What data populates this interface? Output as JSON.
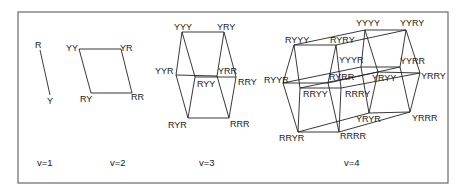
{
  "figure": {
    "frame": {
      "x": 18,
      "y": 12,
      "w": 430,
      "h": 171,
      "stroke": "#6a6a6a"
    },
    "panels": [
      {
        "id": "v1",
        "caption": "v=1",
        "caption_pos": [
          37,
          166
        ],
        "nodes": [
          {
            "label": "R",
            "x": 40,
            "y": 50,
            "lx": 35,
            "ly": 48
          },
          {
            "label": "Y",
            "x": 50,
            "y": 95,
            "lx": 47,
            "ly": 104
          }
        ],
        "edges": [
          [
            0,
            1
          ]
        ]
      },
      {
        "id": "v2",
        "caption": "v=2",
        "caption_pos": [
          110,
          166
        ],
        "nodes": [
          {
            "label": "YY",
            "x": 79,
            "y": 49,
            "lx": 66,
            "ly": 51
          },
          {
            "label": "YR",
            "x": 121,
            "y": 49,
            "lx": 120,
            "ly": 51
          },
          {
            "label": "RY",
            "x": 91,
            "y": 93,
            "lx": 80,
            "ly": 102
          },
          {
            "label": "RR",
            "x": 132,
            "y": 93,
            "lx": 131,
            "ly": 100
          }
        ],
        "edges": [
          [
            0,
            1
          ],
          [
            0,
            2
          ],
          [
            1,
            3
          ],
          [
            2,
            3
          ]
        ]
      },
      {
        "id": "v3",
        "caption": "v=3",
        "caption_pos": [
          199,
          166
        ],
        "nodes": [
          {
            "label": "YYY",
            "x": 182,
            "y": 32,
            "lx": 174,
            "ly": 30
          },
          {
            "label": "YRY",
            "x": 224,
            "y": 32,
            "lx": 217,
            "ly": 30
          },
          {
            "label": "YYR",
            "x": 176,
            "y": 75,
            "lx": 155,
            "ly": 74
          },
          {
            "label": "YRR",
            "x": 217,
            "y": 76,
            "lx": 218,
            "ly": 74
          },
          {
            "label": "RYY",
            "x": 195,
            "y": 77,
            "lx": 197,
            "ly": 87
          },
          {
            "label": "RRY",
            "x": 236,
            "y": 77,
            "lx": 238,
            "ly": 85
          },
          {
            "label": "RYR",
            "x": 188,
            "y": 118,
            "lx": 168,
            "ly": 128
          },
          {
            "label": "RRR",
            "x": 229,
            "y": 118,
            "lx": 230,
            "ly": 127
          }
        ],
        "edges": [
          [
            0,
            1
          ],
          [
            0,
            2
          ],
          [
            0,
            4
          ],
          [
            1,
            3
          ],
          [
            1,
            5
          ],
          [
            2,
            3
          ],
          [
            4,
            5
          ],
          [
            2,
            6
          ],
          [
            4,
            6
          ],
          [
            3,
            7
          ],
          [
            5,
            7
          ],
          [
            6,
            7
          ]
        ]
      },
      {
        "id": "v4",
        "caption": "v=4",
        "caption_pos": [
          344,
          166
        ],
        "nodes": [
          {
            "label": "YYYY",
            "x": 365,
            "y": 30,
            "lx": 356,
            "ly": 26
          },
          {
            "label": "YYRY",
            "x": 406,
            "y": 30,
            "lx": 400,
            "ly": 26
          },
          {
            "label": "RYYY",
            "x": 294,
            "y": 45,
            "lx": 285,
            "ly": 43
          },
          {
            "label": "RYRY",
            "x": 336,
            "y": 45,
            "lx": 330,
            "ly": 43
          },
          {
            "label": "YYYR",
            "x": 361,
            "y": 67,
            "lx": 339,
            "ly": 63
          },
          {
            "label": "YYRR",
            "x": 400,
            "y": 67,
            "lx": 400,
            "ly": 64
          },
          {
            "label": "RYYR",
            "x": 283,
            "y": 83,
            "lx": 264,
            "ly": 83
          },
          {
            "label": "RYRR",
            "x": 328,
            "y": 83,
            "lx": 329,
            "ly": 80
          },
          {
            "label": "YRYY",
            "x": 378,
            "y": 72,
            "lx": 372,
            "ly": 81
          },
          {
            "label": "YRRY",
            "x": 420,
            "y": 73,
            "lx": 421,
            "ly": 79
          },
          {
            "label": "RRYY",
            "x": 300,
            "y": 88,
            "lx": 303,
            "ly": 97
          },
          {
            "label": "RRRY",
            "x": 341,
            "y": 88,
            "lx": 345,
            "ly": 97
          },
          {
            "label": "YRYR",
            "x": 369,
            "y": 113,
            "lx": 356,
            "ly": 122
          },
          {
            "label": "YRRR",
            "x": 410,
            "y": 112,
            "lx": 412,
            "ly": 121
          },
          {
            "label": "RRYR",
            "x": 298,
            "y": 132,
            "lx": 279,
            "ly": 141
          },
          {
            "label": "RRRR",
            "x": 339,
            "y": 132,
            "lx": 340,
            "ly": 139
          }
        ],
        "edges": [
          [
            0,
            1
          ],
          [
            2,
            3
          ],
          [
            0,
            2
          ],
          [
            1,
            3
          ],
          [
            0,
            4
          ],
          [
            1,
            5
          ],
          [
            4,
            5
          ],
          [
            2,
            6
          ],
          [
            3,
            7
          ],
          [
            6,
            7
          ],
          [
            4,
            6
          ],
          [
            5,
            7
          ],
          [
            0,
            8
          ],
          [
            1,
            9
          ],
          [
            8,
            9
          ],
          [
            2,
            10
          ],
          [
            3,
            11
          ],
          [
            10,
            11
          ],
          [
            8,
            10
          ],
          [
            9,
            11
          ],
          [
            4,
            12
          ],
          [
            5,
            13
          ],
          [
            12,
            13
          ],
          [
            6,
            14
          ],
          [
            7,
            15
          ],
          [
            14,
            15
          ],
          [
            12,
            14
          ],
          [
            13,
            15
          ],
          [
            8,
            12
          ],
          [
            9,
            13
          ],
          [
            10,
            14
          ],
          [
            11,
            15
          ]
        ]
      }
    ]
  }
}
